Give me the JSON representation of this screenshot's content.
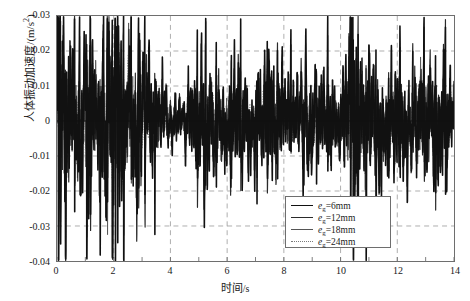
{
  "chart_data": {
    "type": "line",
    "title": "",
    "xlabel": "时间/s",
    "ylabel": "人体振动加速度/(m/s²)",
    "ylabel_main": "人体振动加速度/(m/s",
    "ylabel_sup": "2",
    "ylabel_tail": ")",
    "xlabel_main": "时间",
    "xlabel_unit": "/s",
    "xlim": [
      0,
      14
    ],
    "ylim": [
      -0.04,
      0.03
    ],
    "xticks": [
      "0",
      "2",
      "4",
      "6",
      "8",
      "10",
      "12",
      "14"
    ],
    "xtick_values": [
      0,
      2,
      4,
      6,
      8,
      10,
      12,
      14
    ],
    "yticks": [
      "0.03",
      "0.02",
      "0.01",
      "0",
      "-0.01",
      "-0.02",
      "-0.03",
      "-0.04"
    ],
    "ytick_values": [
      0.03,
      0.02,
      0.01,
      0,
      -0.01,
      -0.02,
      -0.03,
      -0.04
    ],
    "grid": true,
    "grid_style": "dashed",
    "grid_color": "#9a9a9a",
    "frame_color": "#6e6e6e",
    "legend_position": "bottom-center-right",
    "series": [
      {
        "name": "eg=6mm",
        "label_main": "=6mm",
        "var": "e",
        "sub": "g",
        "style": "solid",
        "width": 1.6,
        "color": "#111111"
      },
      {
        "name": "eg=12mm",
        "label_main": "=12mm",
        "var": "e",
        "sub": "g",
        "style": "solid",
        "width": 1.2,
        "color": "#2a2a2a"
      },
      {
        "name": "eg=18mm",
        "label_main": "=18mm",
        "var": "e",
        "sub": "g",
        "style": "solid",
        "width": 0.9,
        "color": "#555555"
      },
      {
        "name": "eg=24mm",
        "label_main": "=24mm",
        "var": "e",
        "sub": "g",
        "style": "dotted",
        "width": 0.9,
        "color": "#7a7a7a"
      }
    ],
    "envelope_profile": [
      {
        "t": 0.0,
        "amp": 0.026
      },
      {
        "t": 0.35,
        "amp": 0.0205
      },
      {
        "t": 0.7,
        "amp": 0.015
      },
      {
        "t": 1.05,
        "amp": 0.0235
      },
      {
        "t": 1.4,
        "amp": 0.014
      },
      {
        "t": 1.75,
        "amp": 0.0245
      },
      {
        "t": 2.1,
        "amp": 0.0255
      },
      {
        "t": 2.45,
        "amp": 0.016
      },
      {
        "t": 2.8,
        "amp": 0.0195
      },
      {
        "t": 3.2,
        "amp": 0.013
      },
      {
        "t": 3.6,
        "amp": 0.0105
      },
      {
        "t": 4.0,
        "amp": 0.006
      },
      {
        "t": 4.4,
        "amp": 0.0045
      },
      {
        "t": 4.8,
        "amp": 0.011
      },
      {
        "t": 5.2,
        "amp": 0.0165
      },
      {
        "t": 5.6,
        "amp": 0.012
      },
      {
        "t": 6.0,
        "amp": 0.01
      },
      {
        "t": 6.4,
        "amp": 0.0135
      },
      {
        "t": 6.8,
        "amp": 0.009
      },
      {
        "t": 7.2,
        "amp": 0.0115
      },
      {
        "t": 7.6,
        "amp": 0.016
      },
      {
        "t": 8.0,
        "amp": 0.0105
      },
      {
        "t": 8.4,
        "amp": 0.0085
      },
      {
        "t": 8.8,
        "amp": 0.0125
      },
      {
        "t": 9.2,
        "amp": 0.0095
      },
      {
        "t": 9.6,
        "amp": 0.011
      },
      {
        "t": 10.0,
        "amp": 0.008
      },
      {
        "t": 10.4,
        "amp": 0.023
      },
      {
        "t": 10.8,
        "amp": 0.0175
      },
      {
        "t": 11.2,
        "amp": 0.013
      },
      {
        "t": 11.6,
        "amp": 0.0115
      },
      {
        "t": 12.0,
        "amp": 0.014
      },
      {
        "t": 12.4,
        "amp": 0.0105
      },
      {
        "t": 12.8,
        "amp": 0.016
      },
      {
        "t": 13.2,
        "amp": 0.012
      },
      {
        "t": 13.6,
        "amp": 0.0145
      },
      {
        "t": 14.0,
        "amp": 0.009
      }
    ]
  }
}
